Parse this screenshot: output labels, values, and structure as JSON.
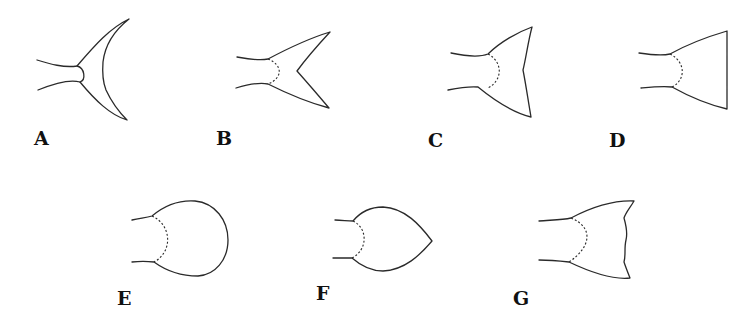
{
  "figure": {
    "panels": [
      {
        "label": "A",
        "shape": "lunate"
      },
      {
        "label": "B",
        "shape": "forked"
      },
      {
        "label": "C",
        "shape": "emarginate"
      },
      {
        "label": "D",
        "shape": "truncate"
      },
      {
        "label": "E",
        "shape": "rounded"
      },
      {
        "label": "F",
        "shape": "pointed"
      },
      {
        "label": "G",
        "shape": "double emarginate"
      }
    ]
  }
}
